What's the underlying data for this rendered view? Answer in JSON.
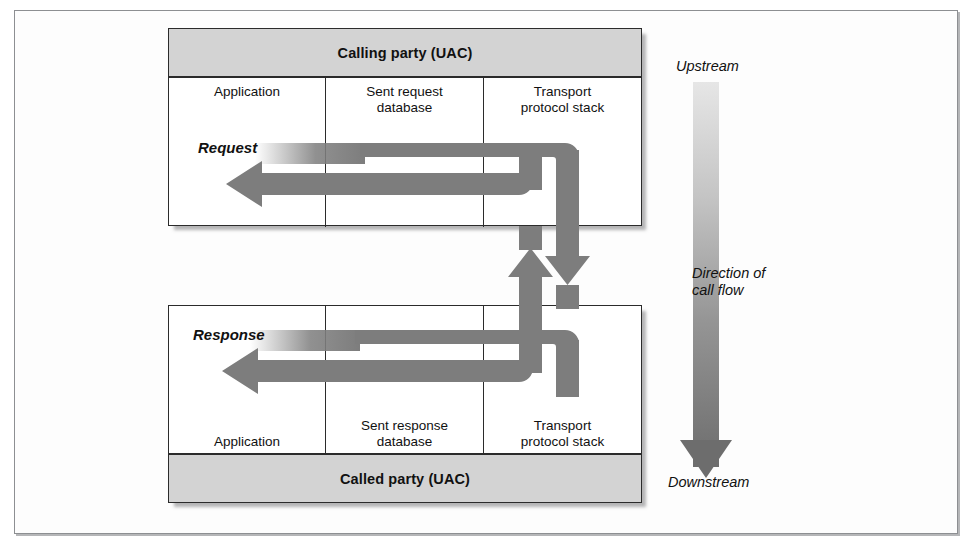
{
  "figure": {
    "colors": {
      "band_fill": "#d3d3d3",
      "box_border": "#2b2b2b",
      "arrow_fill": "#7d7d7d",
      "arrow_fill_dark": "#6e6e6e",
      "frame_border": "#8d8f92",
      "page_background": "#ffffff"
    }
  },
  "calling_party": {
    "band_label": "Calling party (UAC)",
    "columns": [
      {
        "label": "Application"
      },
      {
        "label": "Sent request\ndatabase",
        "line1": "Sent request",
        "line2": "database"
      },
      {
        "label": "Transport\nprotocol stack",
        "line1": "Transport",
        "line2": "protocol stack"
      }
    ]
  },
  "called_party": {
    "band_label": "Called party (UAC)",
    "columns": [
      {
        "label": "Application"
      },
      {
        "label": "Sent response\ndatabase",
        "line1": "Sent response",
        "line2": "database"
      },
      {
        "label": "Transport\nprotocol stack",
        "line1": "Transport",
        "line2": "protocol stack"
      }
    ]
  },
  "flows": [
    {
      "name": "request",
      "label": "Request"
    },
    {
      "name": "response",
      "label": "Response"
    }
  ],
  "call_flow_axis": {
    "top_label": "Upstream",
    "middle_label_line1": "Direction of",
    "middle_label_line2": "call flow",
    "bottom_label": "Downstream",
    "direction": "downward",
    "gradient_from": "#e3e3e3",
    "gradient_to": "#6f6f6f"
  }
}
